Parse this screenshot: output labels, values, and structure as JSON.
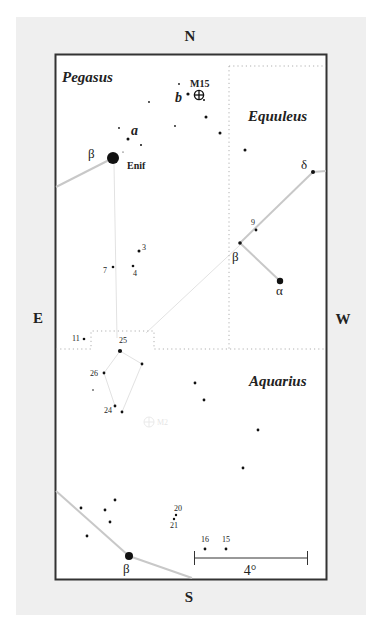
{
  "colors": {
    "panel": "#efefef",
    "frame_fill": "#ffffff",
    "frame_border": "#333333",
    "star": "#111111",
    "stick_line": "#c8c8c8",
    "boundary": "#b0b0b0"
  },
  "compass": {
    "north": "N",
    "south": "S",
    "east": "E",
    "west": "W"
  },
  "constellations": [
    {
      "name": "Pegasus",
      "x": 62,
      "y": 82
    },
    {
      "name": "Equuleus",
      "x": 248,
      "y": 121
    },
    {
      "name": "Aquarius",
      "x": 249,
      "y": 386
    }
  ],
  "objects": [
    {
      "name": "M15",
      "type": "globular-cluster",
      "x": 199,
      "y": 95,
      "label_x": 190,
      "label_y": 83
    }
  ],
  "scale_bar": {
    "label": "4°",
    "x1": 194,
    "x2": 307,
    "y": 558
  },
  "labels": [
    {
      "id": "enif",
      "text": "Enif",
      "x": 127,
      "y": 169,
      "cls": "name"
    },
    {
      "id": "peg-beta",
      "text": "β",
      "x": 88,
      "y": 158,
      "cls": "greek"
    },
    {
      "id": "peg-a",
      "text": "a",
      "x": 131,
      "y": 135,
      "cls": "ital"
    },
    {
      "id": "peg-b",
      "text": "b",
      "x": 175,
      "y": 102,
      "cls": "ital"
    },
    {
      "id": "equ-delta",
      "text": "δ",
      "x": 301,
      "y": 169,
      "cls": "greek"
    },
    {
      "id": "equ-beta",
      "text": "β",
      "x": 232,
      "y": 261,
      "cls": "greek"
    },
    {
      "id": "equ-alpha",
      "text": "α",
      "x": 276,
      "y": 295,
      "cls": "greek"
    },
    {
      "id": "aqr-beta",
      "text": "β",
      "x": 123,
      "y": 573,
      "cls": "greek"
    },
    {
      "id": "n9",
      "text": "9",
      "x": 251,
      "y": 225,
      "cls": "num"
    },
    {
      "id": "n3",
      "text": "3",
      "x": 142,
      "y": 250,
      "cls": "num"
    },
    {
      "id": "n7",
      "text": "7",
      "x": 103,
      "y": 273,
      "cls": "num"
    },
    {
      "id": "n4",
      "text": "4",
      "x": 133,
      "y": 276,
      "cls": "num"
    },
    {
      "id": "n11",
      "text": "11",
      "x": 72,
      "y": 341,
      "cls": "num"
    },
    {
      "id": "n25",
      "text": "25",
      "x": 119,
      "y": 343,
      "cls": "num"
    },
    {
      "id": "n26",
      "text": "26",
      "x": 90,
      "y": 376,
      "cls": "num"
    },
    {
      "id": "n24",
      "text": "24",
      "x": 104,
      "y": 413,
      "cls": "num"
    },
    {
      "id": "n20",
      "text": "20",
      "x": 174,
      "y": 511,
      "cls": "num"
    },
    {
      "id": "n21",
      "text": "21",
      "x": 170,
      "y": 528,
      "cls": "num"
    },
    {
      "id": "n16",
      "text": "16",
      "x": 201,
      "y": 542,
      "cls": "num"
    },
    {
      "id": "n15",
      "text": "15",
      "x": 222,
      "y": 542,
      "cls": "num"
    }
  ],
  "stars": [
    {
      "x": 113,
      "y": 158,
      "r": 6.0
    },
    {
      "x": 179,
      "y": 84,
      "r": 0.9
    },
    {
      "x": 188,
      "y": 94,
      "r": 1.6
    },
    {
      "x": 204,
      "y": 100,
      "r": 1.0
    },
    {
      "x": 149,
      "y": 102,
      "r": 0.9
    },
    {
      "x": 206,
      "y": 117,
      "r": 1.5
    },
    {
      "x": 175,
      "y": 126,
      "r": 0.9
    },
    {
      "x": 220,
      "y": 133,
      "r": 1.5
    },
    {
      "x": 119,
      "y": 128,
      "r": 0.9
    },
    {
      "x": 128,
      "y": 139,
      "r": 1.5
    },
    {
      "x": 141,
      "y": 145,
      "r": 1.0
    },
    {
      "x": 123,
      "y": 152,
      "r": 0.6
    },
    {
      "x": 245,
      "y": 150,
      "r": 1.5
    },
    {
      "x": 313,
      "y": 172,
      "r": 2.0
    },
    {
      "x": 256,
      "y": 230,
      "r": 1.4
    },
    {
      "x": 240,
      "y": 243,
      "r": 1.8
    },
    {
      "x": 280,
      "y": 281,
      "r": 3.2
    },
    {
      "x": 139,
      "y": 251,
      "r": 1.5
    },
    {
      "x": 113,
      "y": 267,
      "r": 1.3
    },
    {
      "x": 133,
      "y": 266,
      "r": 1.3
    },
    {
      "x": 84,
      "y": 339,
      "r": 1.3
    },
    {
      "x": 120,
      "y": 351,
      "r": 2.1
    },
    {
      "x": 142,
      "y": 364,
      "r": 1.4
    },
    {
      "x": 104,
      "y": 373,
      "r": 1.4
    },
    {
      "x": 93,
      "y": 390,
      "r": 0.8
    },
    {
      "x": 115,
      "y": 406,
      "r": 1.4
    },
    {
      "x": 122,
      "y": 412,
      "r": 1.4
    },
    {
      "x": 195,
      "y": 383,
      "r": 1.4
    },
    {
      "x": 204,
      "y": 400,
      "r": 1.4
    },
    {
      "x": 258,
      "y": 430,
      "r": 1.4
    },
    {
      "x": 243,
      "y": 468,
      "r": 1.4
    },
    {
      "x": 81,
      "y": 508,
      "r": 1.4
    },
    {
      "x": 115,
      "y": 500,
      "r": 1.4
    },
    {
      "x": 105,
      "y": 510,
      "r": 1.4
    },
    {
      "x": 110,
      "y": 522,
      "r": 1.4
    },
    {
      "x": 87,
      "y": 536,
      "r": 1.4
    },
    {
      "x": 176,
      "y": 515,
      "r": 1.2
    },
    {
      "x": 174,
      "y": 519,
      "r": 1.2
    },
    {
      "x": 205,
      "y": 549,
      "r": 1.4
    },
    {
      "x": 226,
      "y": 549,
      "r": 1.4
    },
    {
      "x": 129,
      "y": 556,
      "r": 4.0
    }
  ],
  "stick_lines": [
    {
      "x1": 56,
      "y1": 187,
      "x2": 113,
      "y2": 158
    },
    {
      "x1": 313,
      "y1": 172,
      "x2": 240,
      "y2": 243
    },
    {
      "x1": 313,
      "y1": 172,
      "x2": 326,
      "y2": 171
    },
    {
      "x1": 240,
      "y1": 243,
      "x2": 280,
      "y2": 281
    },
    {
      "x1": 56,
      "y1": 491,
      "x2": 129,
      "y2": 556
    },
    {
      "x1": 129,
      "y1": 556,
      "x2": 192,
      "y2": 578
    }
  ],
  "faint_lines": [
    {
      "x1": 114,
      "y1": 164,
      "x2": 117,
      "y2": 338
    },
    {
      "x1": 240,
      "y1": 245,
      "x2": 146,
      "y2": 333
    },
    {
      "x1": 120,
      "y1": 351,
      "x2": 104,
      "y2": 373
    },
    {
      "x1": 104,
      "y1": 373,
      "x2": 115,
      "y2": 406
    },
    {
      "x1": 120,
      "y1": 351,
      "x2": 142,
      "y2": 364
    },
    {
      "x1": 142,
      "y1": 364,
      "x2": 122,
      "y2": 412
    }
  ],
  "boundaries": [
    {
      "points": "229,66 326,66"
    },
    {
      "points": "229,66 229,349"
    },
    {
      "points": "56,349 91,349 91,331 154,331 154,349 326,349"
    }
  ],
  "ghost_object": {
    "label": "M2",
    "x": 149,
    "y": 422
  }
}
